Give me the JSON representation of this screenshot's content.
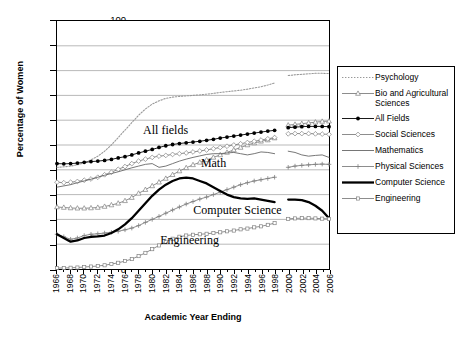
{
  "chart_data": {
    "type": "line",
    "title": "",
    "xlabel": "Academic Year Ending",
    "ylabel": "Percentage of Women",
    "xlim": [
      1966,
      2006
    ],
    "ylim": [
      0,
      100
    ],
    "grid": true,
    "legend_position": "right",
    "x": [
      1966,
      1967,
      1968,
      1969,
      1970,
      1971,
      1972,
      1973,
      1974,
      1975,
      1976,
      1977,
      1978,
      1979,
      1980,
      1981,
      1982,
      1983,
      1984,
      1985,
      1986,
      1987,
      1988,
      1989,
      1990,
      1991,
      1992,
      1993,
      1994,
      1995,
      1996,
      1997,
      1998,
      1999,
      2000,
      2001,
      2002,
      2003,
      2004,
      2005,
      2006
    ],
    "xticks": [
      "1966",
      "1968",
      "1970",
      "1972",
      "1974",
      "1976",
      "1978",
      "1980",
      "1982",
      "1984",
      "1986",
      "1988",
      "1990",
      "1992",
      "1994",
      "1996",
      "1998",
      "2000",
      "2002",
      "2004",
      "2006"
    ],
    "yticks": [
      "0",
      "10",
      "20",
      "30",
      "40",
      "50",
      "60",
      "70",
      "80",
      "90",
      "100"
    ],
    "series": [
      {
        "name": "Psychology",
        "style": "dotted",
        "color": "#999999",
        "values": [
          41.0,
          41.2,
          41.5,
          42.0,
          42.8,
          44.0,
          45.5,
          47.5,
          50.0,
          53.0,
          56.0,
          59.0,
          62.0,
          64.5,
          66.5,
          67.8,
          68.8,
          69.3,
          69.6,
          69.8,
          70.0,
          70.2,
          70.5,
          70.8,
          71.2,
          71.5,
          71.8,
          72.1,
          72.5,
          73.0,
          73.5,
          74.2,
          75.0,
          null,
          78.0,
          78.3,
          78.5,
          78.7,
          78.9,
          78.9,
          78.8
        ]
      },
      {
        "name": "Bio and Agricultural Sciences",
        "style": "solid-marker",
        "marker": "triangle",
        "color": "#808080",
        "values": [
          25.0,
          24.8,
          24.6,
          24.5,
          24.5,
          24.6,
          24.8,
          25.2,
          25.8,
          26.5,
          27.5,
          28.8,
          30.5,
          32.0,
          33.5,
          35.0,
          36.5,
          38.0,
          39.5,
          40.8,
          42.0,
          43.0,
          44.0,
          45.0,
          46.0,
          47.0,
          48.0,
          49.0,
          50.0,
          50.8,
          51.5,
          52.0,
          52.8,
          null,
          58.0,
          58.3,
          58.6,
          58.9,
          59.2,
          59.5,
          59.6
        ]
      },
      {
        "name": "All Fields",
        "style": "solid-marker",
        "marker": "filled-circle",
        "color": "#000000",
        "values": [
          42.5,
          42.4,
          42.5,
          42.7,
          43.0,
          43.3,
          43.5,
          43.8,
          44.2,
          44.8,
          45.3,
          46.0,
          46.8,
          47.5,
          48.2,
          49.0,
          49.7,
          50.2,
          50.6,
          50.9,
          51.2,
          51.5,
          51.9,
          52.3,
          52.8,
          53.2,
          53.6,
          54.0,
          54.4,
          54.8,
          55.2,
          55.6,
          55.9,
          null,
          57.0,
          57.2,
          57.4,
          57.5,
          57.5,
          57.5,
          57.4
        ]
      },
      {
        "name": "Social Sciences",
        "style": "solid-marker",
        "marker": "open-diamond",
        "color": "#808080",
        "values": [
          35.0,
          34.8,
          35.0,
          35.3,
          35.8,
          36.3,
          37.0,
          38.0,
          39.0,
          40.2,
          41.3,
          42.5,
          43.5,
          44.3,
          45.0,
          45.5,
          45.8,
          46.2,
          46.5,
          46.8,
          47.2,
          47.6,
          48.0,
          48.5,
          49.0,
          49.5,
          50.0,
          50.5,
          51.0,
          51.5,
          52.0,
          52.5,
          53.0,
          null,
          54.5,
          54.6,
          54.6,
          54.6,
          54.5,
          54.4,
          54.3
        ]
      },
      {
        "name": "Mathematics",
        "style": "solid-plain",
        "color": "#666666",
        "values": [
          33.0,
          33.5,
          34.0,
          34.8,
          35.5,
          36.2,
          37.0,
          37.8,
          38.5,
          39.2,
          40.0,
          40.8,
          41.5,
          42.2,
          42.5,
          41.0,
          41.5,
          42.5,
          43.5,
          44.3,
          45.0,
          45.6,
          46.2,
          46.5,
          46.5,
          46.8,
          47.0,
          46.5,
          46.0,
          46.5,
          47.2,
          47.0,
          46.5,
          null,
          47.5,
          47.0,
          46.0,
          45.5,
          45.8,
          46.0,
          45.0
        ]
      },
      {
        "name": "Physical Sciences",
        "style": "solid-marker",
        "marker": "plus",
        "color": "#808080",
        "values": [
          14.0,
          13.0,
          12.0,
          12.5,
          13.5,
          14.0,
          14.2,
          14.5,
          14.8,
          15.2,
          15.8,
          16.5,
          17.5,
          18.8,
          20.0,
          21.2,
          22.5,
          23.8,
          25.0,
          26.2,
          27.2,
          28.2,
          29.0,
          30.0,
          31.0,
          32.0,
          33.0,
          34.0,
          34.8,
          35.5,
          36.0,
          36.5,
          37.0,
          null,
          41.0,
          41.5,
          41.8,
          42.0,
          42.2,
          42.3,
          42.2
        ]
      },
      {
        "name": "Computer Science",
        "style": "solid-thick",
        "color": "#000000",
        "values": [
          14.0,
          12.5,
          11.0,
          11.5,
          12.5,
          13.0,
          13.2,
          13.5,
          14.5,
          16.0,
          18.0,
          20.5,
          23.5,
          26.5,
          29.5,
          32.0,
          34.0,
          35.5,
          36.5,
          36.8,
          36.5,
          35.5,
          34.5,
          33.0,
          31.5,
          30.0,
          29.0,
          28.5,
          28.3,
          28.5,
          28.0,
          27.5,
          27.0,
          null,
          28.0,
          28.0,
          27.8,
          27.0,
          25.5,
          23.5,
          20.5
        ]
      },
      {
        "name": "Engineering",
        "style": "solid-marker",
        "marker": "small-square",
        "color": "#808080",
        "values": [
          0.4,
          0.4,
          0.5,
          0.6,
          0.8,
          1.0,
          1.2,
          1.5,
          2.0,
          2.5,
          3.2,
          4.0,
          5.2,
          6.5,
          8.0,
          9.5,
          11.0,
          12.2,
          13.0,
          13.5,
          13.8,
          14.0,
          14.2,
          14.5,
          14.8,
          15.2,
          15.5,
          16.0,
          16.3,
          16.8,
          17.2,
          17.8,
          18.5,
          null,
          20.2,
          20.4,
          20.5,
          20.5,
          20.4,
          20.3,
          20.2
        ]
      }
    ],
    "annotations": [
      {
        "text": "All fields",
        "x": 1982.0,
        "y": 55.5
      },
      {
        "text": "Math",
        "x": 1989.0,
        "y": 42.5
      },
      {
        "text": "Computer Science",
        "x": 1992.5,
        "y": 23.5
      },
      {
        "text": "Engineering",
        "x": 1985.5,
        "y": 11.5
      }
    ]
  },
  "legend": {
    "items": [
      {
        "label": "Psychology"
      },
      {
        "label": "Bio and Agricultural Sciences"
      },
      {
        "label": "All Fields"
      },
      {
        "label": "Social Sciences"
      },
      {
        "label": "Mathematics"
      },
      {
        "label": "Physical Sciences"
      },
      {
        "label": "Computer Science"
      },
      {
        "label": "Engineering"
      }
    ]
  }
}
